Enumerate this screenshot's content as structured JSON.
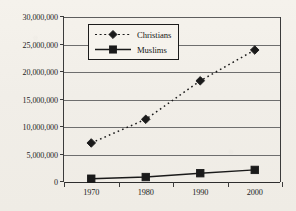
{
  "chart_data": {
    "type": "line",
    "title": "",
    "xlabel": "",
    "ylabel": "",
    "categories": [
      "1970",
      "1980",
      "1990",
      "2000"
    ],
    "ylim": [
      0,
      30000000
    ],
    "ytick_values": [
      0,
      5000000,
      10000000,
      15000000,
      20000000,
      25000000,
      30000000
    ],
    "ytick_labels": [
      "0",
      "5,000,000",
      "10,000,000",
      "15,000,000",
      "20,000,000",
      "25,000,000",
      "30,000,000"
    ],
    "grid": true,
    "legend_position": "upper-left-inside",
    "series": [
      {
        "name": "Christians",
        "values": [
          7100000,
          11400000,
          18400000,
          24000000
        ],
        "line_style": "dotted",
        "marker": "diamond",
        "color": "#1a1a1a"
      },
      {
        "name": "Muslims",
        "values": [
          600000,
          900000,
          1600000,
          2200000
        ],
        "line_style": "solid",
        "marker": "square",
        "color": "#1a1a1a"
      }
    ]
  },
  "legend": {
    "items": [
      {
        "label": "Christians",
        "marker": "diamond-marker",
        "line": "dotted-line"
      },
      {
        "label": "Muslims",
        "marker": "square-marker",
        "line": "solid-line"
      }
    ]
  },
  "colors": {
    "paper": "#f3f0ea",
    "ink": "#1a1a1a",
    "gridline": "#6e6e6e"
  }
}
